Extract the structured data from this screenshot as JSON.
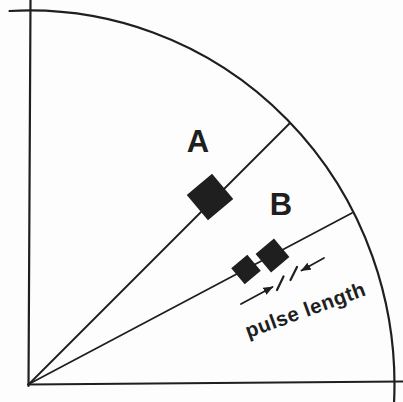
{
  "diagram": {
    "background_color": "#fdfdfd",
    "ink_color": "#1f1f1f",
    "labels": {
      "target_a": "A",
      "target_b": "B",
      "annotation": "pulse length"
    }
  }
}
